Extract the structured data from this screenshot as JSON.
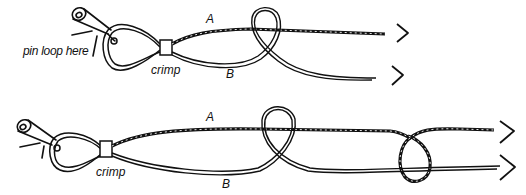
{
  "diagram": {
    "colors": {
      "ink": "#111111",
      "background": "#ffffff"
    },
    "panels": [
      {
        "id": "step-1",
        "labels": {
          "pin_note": "pin loop here",
          "crimp": "crimp",
          "strand_a": "A",
          "strand_b": "B"
        },
        "arrows": [
          "chevron-right",
          "chevron-right"
        ]
      },
      {
        "id": "step-2",
        "labels": {
          "crimp": "crimp",
          "strand_a": "A",
          "strand_b": "B"
        },
        "arrows": [
          "chevron-right",
          "chevron-right"
        ]
      }
    ]
  }
}
